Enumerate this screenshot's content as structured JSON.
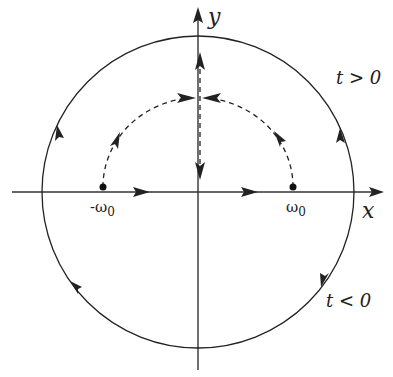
{
  "diagram": {
    "type": "contour-plot",
    "axes": {
      "x_label": "x",
      "y_label": "y"
    },
    "poles": [
      {
        "label": "-ω",
        "subscript": "0",
        "x": -1
      },
      {
        "label": "ω",
        "subscript": "0",
        "x": 1
      }
    ],
    "regions": {
      "upper": "t > 0",
      "lower": "t < 0"
    },
    "colors": {
      "ink": "#222222",
      "background": "#ffffff"
    }
  }
}
